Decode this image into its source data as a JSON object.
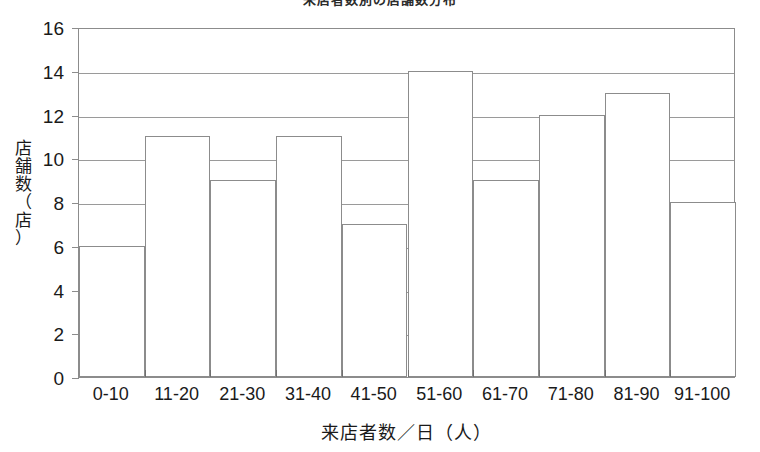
{
  "chart_data": {
    "type": "bar",
    "title": "来店者数別の店舗数分布",
    "title_note": "clipped-at-top-edge",
    "categories": [
      "0-10",
      "11-20",
      "21-30",
      "31-40",
      "41-50",
      "51-60",
      "61-70",
      "71-80",
      "81-90",
      "91-100"
    ],
    "values": [
      6,
      11,
      9,
      11,
      7,
      14,
      9,
      12,
      13,
      8
    ],
    "xlabel": "来店者数／日（人）",
    "ylabel": "店舗数（店）",
    "ylabel_chars": [
      "店",
      "舗",
      "数",
      "（",
      "店",
      "）"
    ],
    "ylim": [
      0,
      16
    ],
    "ytick_values": [
      0,
      2,
      4,
      6,
      8,
      10,
      12,
      14,
      16
    ],
    "ytick_labels": [
      "0",
      "2",
      "4",
      "6",
      "8",
      "10",
      "12",
      "14",
      "16"
    ],
    "grid": true,
    "grid_axis": "y",
    "legend": false,
    "bar_gap": 0,
    "bar_fill": "#ffffff",
    "bar_edge_color": "#8c8c8c",
    "grid_color": "#9a9a9a",
    "axis_color": "#8c8c8c",
    "text_color": "#1a1a1a",
    "background": "#ffffff"
  }
}
